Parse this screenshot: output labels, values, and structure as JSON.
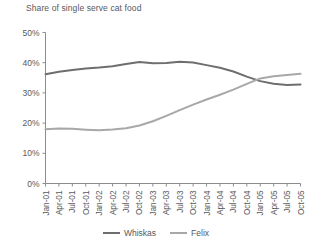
{
  "chart_data": {
    "type": "line",
    "title": "Share of single serve cat food",
    "xlabel": "",
    "ylabel": "",
    "ylim": [
      0,
      50
    ],
    "ytick_values": [
      0,
      10,
      20,
      30,
      40,
      50
    ],
    "ytick_labels": [
      "0%",
      "10%",
      "20%",
      "30%",
      "40%",
      "50%"
    ],
    "grid": false,
    "legend_position": "bottom-center",
    "categories": [
      "Jan-01",
      "Apr-01",
      "Jul-01",
      "Oct-01",
      "Jan-02",
      "Apr-02",
      "Jul-02",
      "Oct-02",
      "Jan-03",
      "Apr-03",
      "Jul-03",
      "Oct-03",
      "Jan-04",
      "Apr-04",
      "Jul-04",
      "Oct-04",
      "Jan-05",
      "Apr-05",
      "Jul-05",
      "Oct-05"
    ],
    "series": [
      {
        "name": "Whiskas",
        "color": "#6e6e70",
        "values": [
          36.2,
          37.0,
          37.6,
          38.1,
          38.4,
          38.8,
          39.6,
          40.2,
          39.8,
          39.9,
          40.3,
          40.1,
          39.2,
          38.3,
          37.1,
          35.4,
          33.9,
          33.0,
          32.6,
          32.8
        ]
      },
      {
        "name": "Felix",
        "color": "#a8a8aa",
        "values": [
          18.0,
          18.2,
          18.1,
          17.8,
          17.6,
          17.9,
          18.3,
          19.2,
          20.6,
          22.4,
          24.3,
          26.1,
          27.8,
          29.4,
          31.1,
          33.0,
          34.8,
          35.5,
          35.9,
          36.3
        ]
      }
    ]
  },
  "legend": {
    "items": [
      {
        "label": "Whiskas",
        "color": "#6e6e70"
      },
      {
        "label": "Felix",
        "color": "#a8a8aa"
      }
    ]
  },
  "colors": {
    "text": "#58585a",
    "axis": "#8c8c8e",
    "whiskas": "#6e6e70",
    "felix": "#a8a8aa",
    "background": "#ffffff"
  }
}
